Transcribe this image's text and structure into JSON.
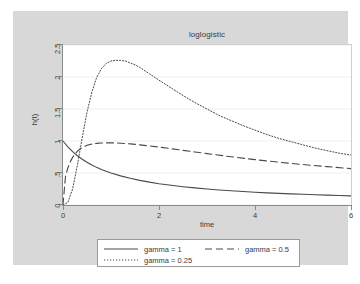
{
  "chart_data": {
    "type": "line",
    "title": "loglogistic",
    "xlabel": "time",
    "ylabel": "h(t)",
    "xlim": [
      0,
      6
    ],
    "ylim": [
      0,
      2.5
    ],
    "xticks": [
      "0",
      "2",
      "4",
      "6"
    ],
    "xtick_values": [
      0,
      2,
      4,
      6
    ],
    "yticks": [
      "0",
      ".5",
      "1",
      "1.5",
      "2",
      "2.5"
    ],
    "ytick_values": [
      0,
      0.5,
      1,
      1.5,
      2,
      2.5
    ],
    "grid": "horizontal",
    "legend_position": "bottom",
    "series": [
      {
        "name": "gamma = 1",
        "style": "solid",
        "color": "#4a4a4a",
        "x": [
          0,
          0.1,
          0.2,
          0.3,
          0.4,
          0.5,
          0.6,
          0.7,
          0.8,
          0.9,
          1,
          1.2,
          1.4,
          1.6,
          1.8,
          2,
          2.25,
          2.5,
          2.75,
          3,
          3.25,
          3.5,
          3.75,
          4,
          4.25,
          4.5,
          4.75,
          5,
          5.25,
          5.5,
          5.75,
          6
        ],
        "values": [
          1,
          0.909,
          0.833,
          0.769,
          0.714,
          0.667,
          0.625,
          0.588,
          0.556,
          0.526,
          0.5,
          0.455,
          0.417,
          0.385,
          0.357,
          0.333,
          0.308,
          0.286,
          0.267,
          0.25,
          0.235,
          0.222,
          0.211,
          0.2,
          0.19,
          0.182,
          0.174,
          0.167,
          0.16,
          0.154,
          0.148,
          0.143
        ]
      },
      {
        "name": "gamma = 0.5",
        "style": "dashed",
        "color": "#4a4a4a",
        "x": [
          0,
          0.05,
          0.1,
          0.15,
          0.2,
          0.3,
          0.4,
          0.5,
          0.6,
          0.7,
          0.8,
          0.9,
          1,
          1.1,
          1.2,
          1.4,
          1.6,
          1.8,
          2,
          2.25,
          2.5,
          2.75,
          3,
          3.5,
          4,
          4.5,
          5,
          5.5,
          6
        ],
        "values": [
          0,
          0.436,
          0.578,
          0.673,
          0.744,
          0.842,
          0.9,
          0.933,
          0.952,
          0.963,
          0.969,
          0.971,
          0.971,
          0.969,
          0.966,
          0.955,
          0.94,
          0.923,
          0.905,
          0.88,
          0.854,
          0.828,
          0.803,
          0.754,
          0.709,
          0.668,
          0.632,
          0.599,
          0.569
        ]
      },
      {
        "name": "gamma = 0.25",
        "style": "dotted",
        "color": "#4a4a4a",
        "x": [
          0,
          0.1,
          0.2,
          0.3,
          0.4,
          0.5,
          0.6,
          0.7,
          0.8,
          0.9,
          1,
          1.1,
          1.2,
          1.3,
          1.4,
          1.5,
          1.6,
          1.8,
          2,
          2.25,
          2.5,
          2.75,
          3,
          3.25,
          3.5,
          3.75,
          4,
          4.25,
          4.5,
          4.75,
          5,
          5.25,
          5.5,
          5.75,
          6
        ],
        "values": [
          0,
          0.04,
          0.25,
          0.62,
          1.05,
          1.45,
          1.76,
          1.99,
          2.13,
          2.21,
          2.25,
          2.26,
          2.26,
          2.25,
          2.22,
          2.19,
          2.15,
          2.05,
          1.95,
          1.83,
          1.71,
          1.6,
          1.5,
          1.4,
          1.32,
          1.24,
          1.17,
          1.1,
          1.04,
          0.99,
          0.94,
          0.89,
          0.85,
          0.81,
          0.78
        ]
      }
    ]
  },
  "colors": {
    "graph_region": "#d8d8d8",
    "plot_background": "#ffffff",
    "axis": "#8a8a8a",
    "gridline": "#ebebeb",
    "line": "#4a4a4a",
    "text": "#3a3a3a"
  }
}
